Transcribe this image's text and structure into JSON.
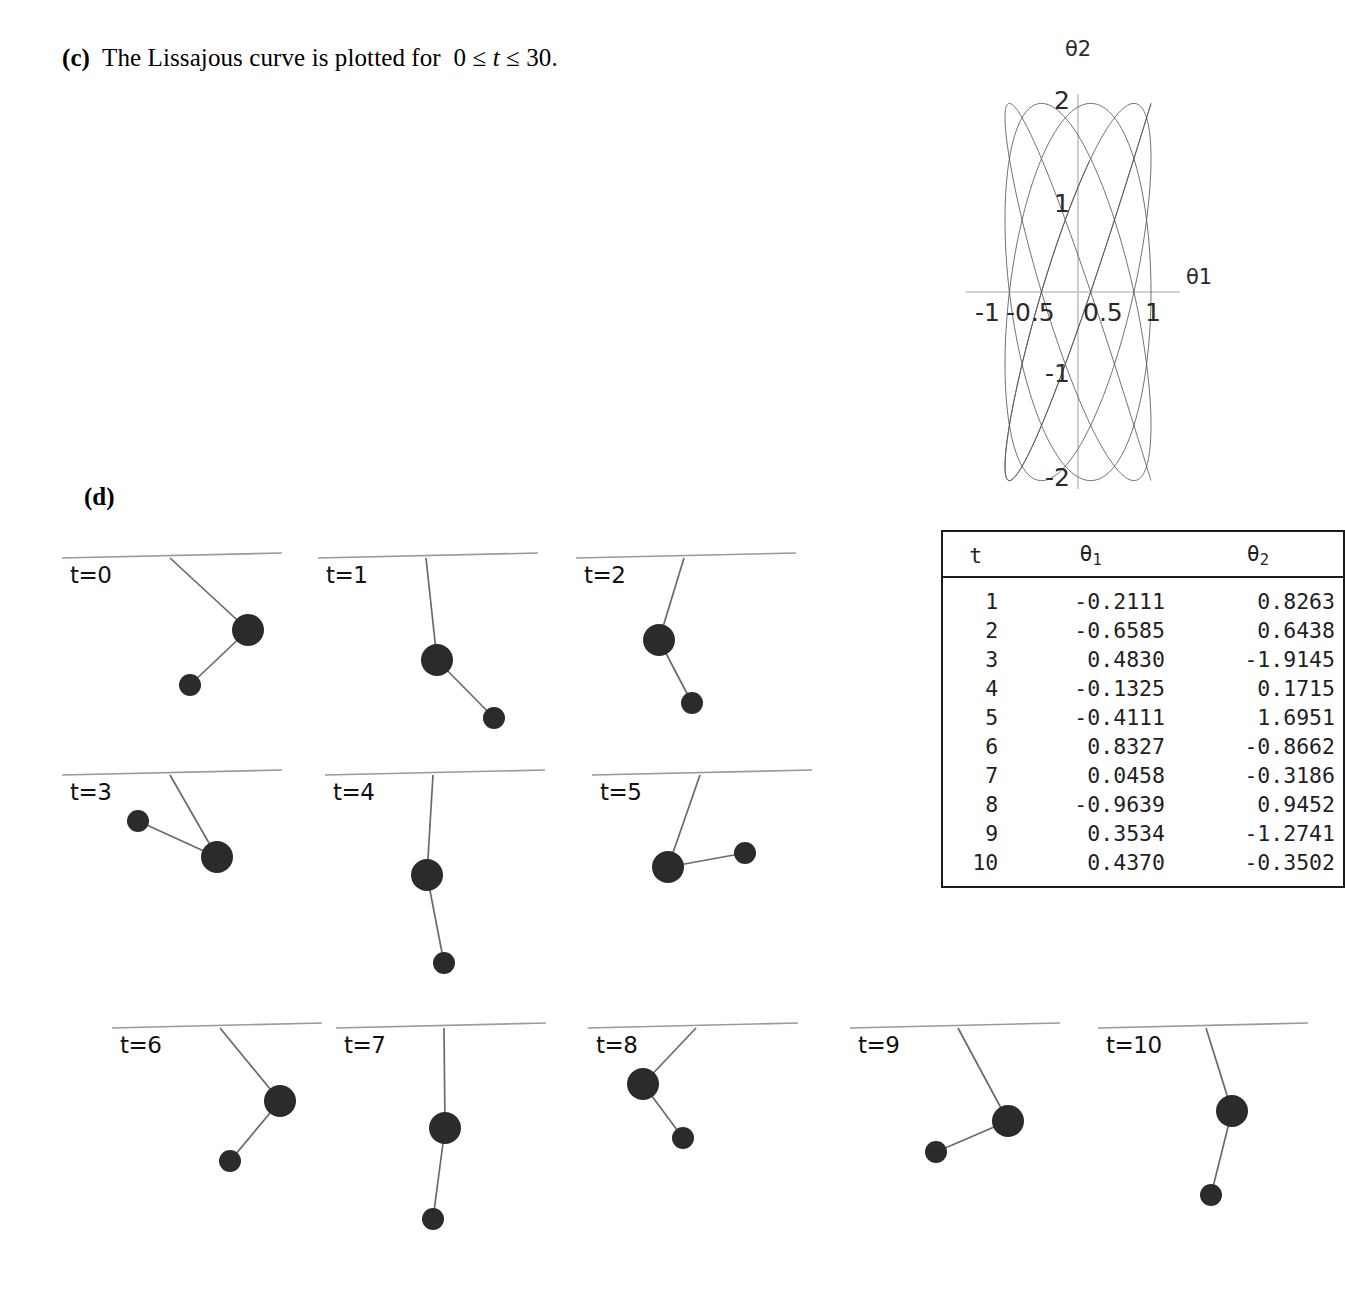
{
  "part_c": {
    "label": "(c)",
    "text_before": "The Lissajous curve is plotted for",
    "inequality": "0 ≤ t ≤ 30.",
    "full_text": "(c) The Lissajous curve is plotted for 0 ≤ t ≤ 30."
  },
  "part_d": {
    "label": "(d)"
  },
  "chart_data": {
    "type": "line",
    "title": "",
    "xlabel": "θ1",
    "ylabel": "θ2",
    "xlim": [
      -1.35,
      1.35
    ],
    "ylim": [
      -2.35,
      2.35
    ],
    "x_ticks": [
      -1,
      -0.5,
      0.5,
      1
    ],
    "x_tick_labels": [
      "-1",
      "-0.5",
      "0.5",
      "1"
    ],
    "y_ticks": [
      -2,
      -1,
      1,
      2
    ],
    "y_tick_labels": [
      "-2",
      "-1",
      "1",
      "2"
    ],
    "grid": false,
    "legend": null,
    "line_color": "#555555",
    "t_range": [
      0,
      30
    ],
    "series": [
      {
        "name": "Lissajous (θ1, θ2)",
        "x_amplitude": 1.0,
        "y_amplitude": 2.05,
        "x_freq": 1.0,
        "y_freq": 1.125,
        "phase": 3.14159,
        "n_points": 1400
      }
    ]
  },
  "table": {
    "headers": [
      "t",
      "θ",
      "θ"
    ],
    "header_subs": [
      "",
      "1",
      "2"
    ],
    "rows": [
      {
        "t": "1",
        "theta1": "-0.2111",
        "theta2": " 0.8263"
      },
      {
        "t": "2",
        "theta1": "-0.6585",
        "theta2": " 0.6438"
      },
      {
        "t": "3",
        "theta1": " 0.4830",
        "theta2": "-1.9145"
      },
      {
        "t": "4",
        "theta1": "-0.1325",
        "theta2": " 0.1715"
      },
      {
        "t": "5",
        "theta1": "-0.4111",
        "theta2": " 1.6951"
      },
      {
        "t": "6",
        "theta1": " 0.8327",
        "theta2": "-0.8662"
      },
      {
        "t": "7",
        "theta1": " 0.0458",
        "theta2": "-0.3186"
      },
      {
        "t": "8",
        "theta1": "-0.9639",
        "theta2": " 0.9452"
      },
      {
        "t": "9",
        "theta1": " 0.3534",
        "theta2": "-1.2741"
      },
      {
        "t": "10",
        "theta1": " 0.4370",
        "theta2": "-0.3502"
      }
    ]
  },
  "pendulums": [
    {
      "label": "t=0",
      "bob1": {
        "x": 78,
        "y": 72
      },
      "bob2": {
        "x": 20,
        "y": 127
      }
    },
    {
      "label": "t=1",
      "bob1": {
        "x": 11,
        "y": 102
      },
      "bob2": {
        "x": 68,
        "y": 160
      }
    },
    {
      "label": "t=2",
      "bob1": {
        "x": -25,
        "y": 82
      },
      "bob2": {
        "x": 8,
        "y": 145
      }
    },
    {
      "label": "t=3",
      "bob1": {
        "x": 47,
        "y": 82
      },
      "bob2": {
        "x": -32,
        "y": 46
      }
    },
    {
      "label": "t=4",
      "bob1": {
        "x": -6,
        "y": 100
      },
      "bob2": {
        "x": 11,
        "y": 188
      }
    },
    {
      "label": "t=5",
      "bob1": {
        "x": -32,
        "y": 92
      },
      "bob2": {
        "x": 45,
        "y": 78
      }
    },
    {
      "label": "t=6",
      "bob1": {
        "x": 60,
        "y": 73
      },
      "bob2": {
        "x": 10,
        "y": 133
      }
    },
    {
      "label": "t=7",
      "bob1": {
        "x": 1,
        "y": 100
      },
      "bob2": {
        "x": -11,
        "y": 191
      }
    },
    {
      "label": "t=8",
      "bob1": {
        "x": -53,
        "y": 56
      },
      "bob2": {
        "x": -13,
        "y": 110
      }
    },
    {
      "label": "t=9",
      "bob1": {
        "x": 50,
        "y": 93
      },
      "bob2": {
        "x": -22,
        "y": 124
      }
    },
    {
      "label": "t=10",
      "bob1": {
        "x": 26,
        "y": 83
      },
      "bob2": {
        "x": 5,
        "y": 167
      }
    }
  ],
  "style": {
    "ink": "#1a1a1a",
    "rod": "#6a6a6a",
    "ceiling": "#9a9a9a",
    "curve": "#555555",
    "axis": "#b8b8b8"
  }
}
